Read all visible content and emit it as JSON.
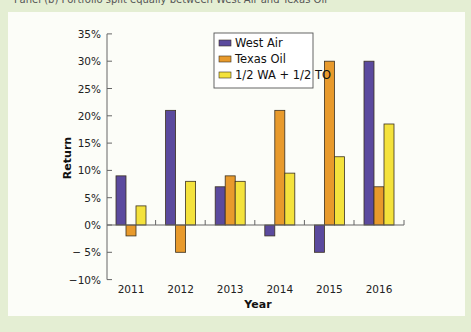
{
  "caption": "Panel (b) Portfolio split equally between West Air and Texas Oil",
  "colors": {
    "background": "#e4eed3",
    "panel": "#fcfdf8",
    "west_air": "#5b4a9e",
    "texas_oil": "#e89a2c",
    "mix": "#f4e23c",
    "outline": "#3a3020",
    "axis": "#666666"
  },
  "chart_data": {
    "type": "bar",
    "title": "",
    "xlabel": "Year",
    "ylabel": "Return",
    "categories": [
      "2011",
      "2012",
      "2013",
      "2014",
      "2015",
      "2016"
    ],
    "series": [
      {
        "name": "West Air",
        "values": [
          9,
          21,
          7,
          -2,
          -5,
          30
        ]
      },
      {
        "name": "Texas Oil",
        "values": [
          -2,
          -5,
          9,
          21,
          30,
          7
        ]
      },
      {
        "name": "1/2 WA + 1/2 TO",
        "values": [
          3.5,
          8,
          8,
          9.5,
          12.5,
          18.5
        ]
      }
    ],
    "ylim": [
      -10,
      35
    ],
    "yticks": [
      35,
      30,
      25,
      20,
      15,
      10,
      5,
      0,
      -5,
      -10
    ],
    "ytick_labels": [
      "35%",
      "30%",
      "25%",
      "20%",
      "15%",
      "10%",
      "5%",
      "0%",
      "− 5%",
      "−10%"
    ],
    "grid": false,
    "legend_position": "upper center (inside plot)"
  }
}
